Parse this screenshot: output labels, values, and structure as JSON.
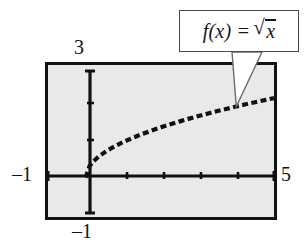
{
  "figure": {
    "name": "square-root-function-graph",
    "background_color": "#ffffff",
    "plot_background_color": "#e9e9e9",
    "axis_color": "#111111",
    "curve_color": "#111111",
    "callout_border_color": "#4a4a4a"
  },
  "callout": {
    "name": "function-label-callout",
    "expression": "f(x) =",
    "radical_symbol": "√",
    "radicand": "x",
    "full_text": "f(x) = √x"
  },
  "labels": {
    "y_max": "3",
    "x_min": "–1",
    "x_max": "5",
    "y_min": "–1"
  },
  "chart_data": {
    "type": "line",
    "title": "",
    "subtitle": "",
    "xlabel": "",
    "ylabel": "",
    "function": "f(x) = sqrt(x)",
    "domain_shown": [
      0,
      5
    ],
    "xlim": [
      -1,
      5
    ],
    "ylim": [
      -1,
      3
    ],
    "xticks": [
      1,
      2,
      3,
      4,
      5
    ],
    "yticks": [
      1,
      2
    ],
    "xtick_labels": [
      "",
      "",
      "",
      "",
      "5"
    ],
    "ytick_labels": [
      "",
      ""
    ],
    "corner_labels": {
      "top_y": "3",
      "left_x": "–1",
      "right_x": "5",
      "bottom_y": "–1"
    },
    "grid": false,
    "legend": false,
    "line_style": "dashed",
    "series": [
      {
        "name": "f(x) = √x",
        "x": [
          0,
          0.1,
          0.2,
          0.3,
          0.4,
          0.5,
          0.6,
          0.7,
          0.8,
          0.9,
          1.0,
          1.25,
          1.5,
          1.75,
          2.0,
          2.25,
          2.5,
          2.75,
          3.0,
          3.25,
          3.5,
          3.75,
          4.0,
          4.25,
          4.5,
          4.75,
          5.0
        ],
        "y": [
          0,
          0.316,
          0.447,
          0.548,
          0.632,
          0.707,
          0.775,
          0.837,
          0.894,
          0.949,
          1.0,
          1.118,
          1.225,
          1.323,
          1.414,
          1.5,
          1.581,
          1.658,
          1.732,
          1.803,
          1.871,
          1.936,
          2.0,
          2.062,
          2.121,
          2.179,
          2.236
        ]
      }
    ],
    "annotations": [
      {
        "text": "f(x) = √x",
        "points_to_x": 4.0,
        "points_to_y": 2.0
      }
    ]
  }
}
